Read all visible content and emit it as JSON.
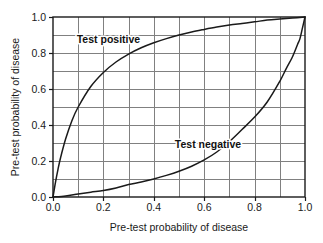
{
  "figure": {
    "background_color": "#ffffff",
    "plot_area": {
      "left": 53,
      "top": 17,
      "right": 305,
      "bottom": 197
    }
  },
  "style": {
    "grid_color": "#808080",
    "axis_color": "#1a1a1a",
    "curve_color": "#1a1a1a",
    "text_color": "#1a1a1a",
    "label_halo_color": "#ffffff"
  },
  "chart_data": {
    "type": "line",
    "title": "",
    "subtitle": "",
    "xlabel": "Pre-test probability of disease",
    "ylabel": "Pre-test probability of disease",
    "xlim": [
      0.0,
      1.0
    ],
    "ylim": [
      0.0,
      1.0
    ],
    "xticks": [
      0.0,
      0.2,
      0.4,
      0.6,
      0.8,
      1.0
    ],
    "yticks": [
      0.0,
      0.2,
      0.4,
      0.6,
      0.8,
      1.0
    ],
    "xtick_labels": [
      "0.0",
      "0.2",
      "0.4",
      "0.6",
      "0.8",
      "1.0"
    ],
    "ytick_labels": [
      "0.0",
      "0.2",
      "0.4",
      "0.6",
      "0.8",
      "1.0"
    ],
    "grid": true,
    "grid_minor_step": 0.1,
    "grid_columns": 10,
    "grid_rows": 10,
    "legend": "inline-annotations",
    "legend_position": "in-plot",
    "series": [
      {
        "name": "Test positive",
        "annotation": "Test positive",
        "annotation_x": 0.22,
        "annotation_y": 0.855,
        "x": [
          0.0,
          0.01,
          0.02,
          0.03,
          0.05,
          0.075,
          0.1,
          0.15,
          0.2,
          0.25,
          0.3,
          0.35,
          0.4,
          0.45,
          0.5,
          0.55,
          0.6,
          0.65,
          0.7,
          0.75,
          0.8,
          0.85,
          0.9,
          0.95,
          1.0
        ],
        "y": [
          0.0,
          0.083,
          0.155,
          0.218,
          0.322,
          0.424,
          0.5,
          0.614,
          0.692,
          0.75,
          0.794,
          0.829,
          0.857,
          0.88,
          0.9,
          0.917,
          0.931,
          0.944,
          0.955,
          0.964,
          0.973,
          0.983,
          0.989,
          0.994,
          1.0
        ]
      },
      {
        "name": "Test negative",
        "annotation": "Test negative",
        "annotation_x": 0.615,
        "annotation_y": 0.275,
        "x": [
          0.0,
          0.05,
          0.1,
          0.15,
          0.2,
          0.25,
          0.3,
          0.35,
          0.4,
          0.45,
          0.5,
          0.55,
          0.6,
          0.65,
          0.7,
          0.75,
          0.8,
          0.85,
          0.9,
          0.925,
          0.95,
          0.97,
          0.98,
          0.99,
          1.0
        ],
        "y": [
          0.0,
          0.006,
          0.017,
          0.027,
          0.036,
          0.05,
          0.069,
          0.083,
          0.1,
          0.12,
          0.143,
          0.171,
          0.206,
          0.25,
          0.308,
          0.375,
          0.444,
          0.528,
          0.643,
          0.712,
          0.778,
          0.846,
          0.88,
          0.94,
          1.0
        ]
      }
    ]
  }
}
